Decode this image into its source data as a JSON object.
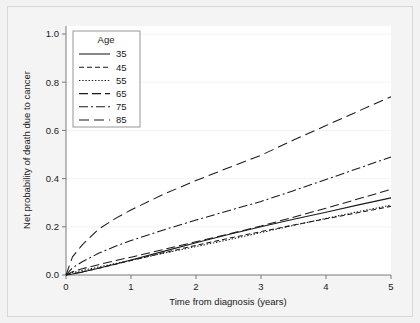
{
  "chart_data": {
    "type": "line",
    "title": "",
    "xlabel": "Time from diagnosis (years)",
    "ylabel": "Net probability of death due to cancer",
    "xlim": [
      0,
      5
    ],
    "ylim": [
      0,
      1.0
    ],
    "xticks": [
      "0",
      "1",
      "2",
      "3",
      "4",
      "5"
    ],
    "xtick_values": [
      0,
      1,
      2,
      3,
      4,
      5
    ],
    "yticks": [
      "0.0",
      "0.2",
      "0.4",
      "0.6",
      "0.8",
      "1.0"
    ],
    "ytick_values": [
      0.0,
      0.2,
      0.4,
      0.6,
      0.8,
      1.0
    ],
    "grid": false,
    "legend_position": "top-left",
    "legend_title": "Age",
    "x": [
      0,
      0.1,
      0.25,
      0.5,
      0.75,
      1.0,
      1.5,
      2.0,
      2.5,
      3.0,
      3.5,
      4.0,
      4.5,
      5.0
    ],
    "series": [
      {
        "name": "35",
        "label": "35",
        "style": "solid",
        "dasharray": "",
        "values": [
          0.0,
          0.004,
          0.012,
          0.028,
          0.045,
          0.062,
          0.098,
          0.134,
          0.168,
          0.2,
          0.231,
          0.26,
          0.291,
          0.32
        ]
      },
      {
        "name": "45",
        "label": "45",
        "style": "dashed",
        "dasharray": "5,3",
        "values": [
          0.0,
          0.005,
          0.013,
          0.028,
          0.044,
          0.06,
          0.092,
          0.123,
          0.152,
          0.18,
          0.207,
          0.233,
          0.259,
          0.285
        ]
      },
      {
        "name": "55",
        "label": "55",
        "style": "dotted",
        "dasharray": "1.4,1.8",
        "values": [
          0.0,
          0.01,
          0.019,
          0.033,
          0.047,
          0.061,
          0.09,
          0.118,
          0.146,
          0.176,
          0.206,
          0.235,
          0.263,
          0.29
        ]
      },
      {
        "name": "65",
        "label": "65",
        "style": "long-dash",
        "dasharray": "9,4",
        "values": [
          0.0,
          0.014,
          0.026,
          0.043,
          0.059,
          0.074,
          0.106,
          0.138,
          0.17,
          0.203,
          0.24,
          0.277,
          0.316,
          0.355
        ]
      },
      {
        "name": "75",
        "label": "75",
        "style": "dash-dot",
        "dasharray": "9,3,2,3",
        "values": [
          0.0,
          0.03,
          0.055,
          0.09,
          0.118,
          0.143,
          0.187,
          0.228,
          0.267,
          0.305,
          0.35,
          0.396,
          0.443,
          0.49
        ]
      },
      {
        "name": "85",
        "label": "85",
        "style": "long-dash-wide",
        "dasharray": "10,5",
        "values": [
          0.0,
          0.075,
          0.125,
          0.19,
          0.233,
          0.27,
          0.335,
          0.392,
          0.445,
          0.497,
          0.56,
          0.62,
          0.68,
          0.74
        ]
      }
    ]
  }
}
